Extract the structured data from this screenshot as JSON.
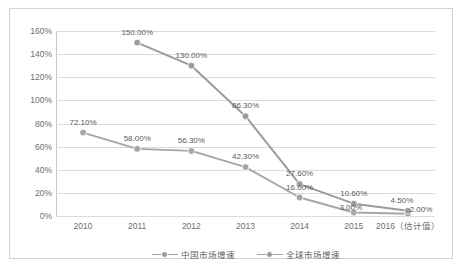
{
  "chart_data": {
    "type": "line",
    "title": "",
    "xlabel": "",
    "ylabel": "",
    "categories": [
      "2010",
      "2011",
      "2012",
      "2013",
      "2014",
      "2015",
      "2016（估计值）"
    ],
    "ylim": [
      0,
      160
    ],
    "yticks": [
      "0%",
      "20%",
      "40%",
      "60%",
      "80%",
      "100%",
      "120%",
      "140%",
      "160%"
    ],
    "ytick_values": [
      0,
      20,
      40,
      60,
      80,
      100,
      120,
      140,
      160
    ],
    "grid": true,
    "legend_position": "bottom",
    "series": [
      {
        "name": "中国市场增速",
        "color": "#a6a6a6",
        "values": [
          72.1,
          58.0,
          56.3,
          42.3,
          16.0,
          3.0,
          2.0
        ],
        "labels": [
          "72.10%",
          "58.00%",
          "56.30%",
          "42.30%",
          "16.00%",
          "3.00%",
          "2.00%"
        ]
      },
      {
        "name": "全球市场增速",
        "color": "#9a9a9a",
        "values": [
          null,
          150.0,
          130.0,
          86.3,
          27.6,
          10.6,
          4.5
        ],
        "labels": [
          "",
          "150.00%",
          "130.00%",
          "86.30%",
          "27.60%",
          "10.60%",
          "4.50%"
        ]
      }
    ]
  },
  "legend": {
    "items": [
      {
        "label": "中国市场增速"
      },
      {
        "label": "全球市场增速"
      }
    ]
  }
}
